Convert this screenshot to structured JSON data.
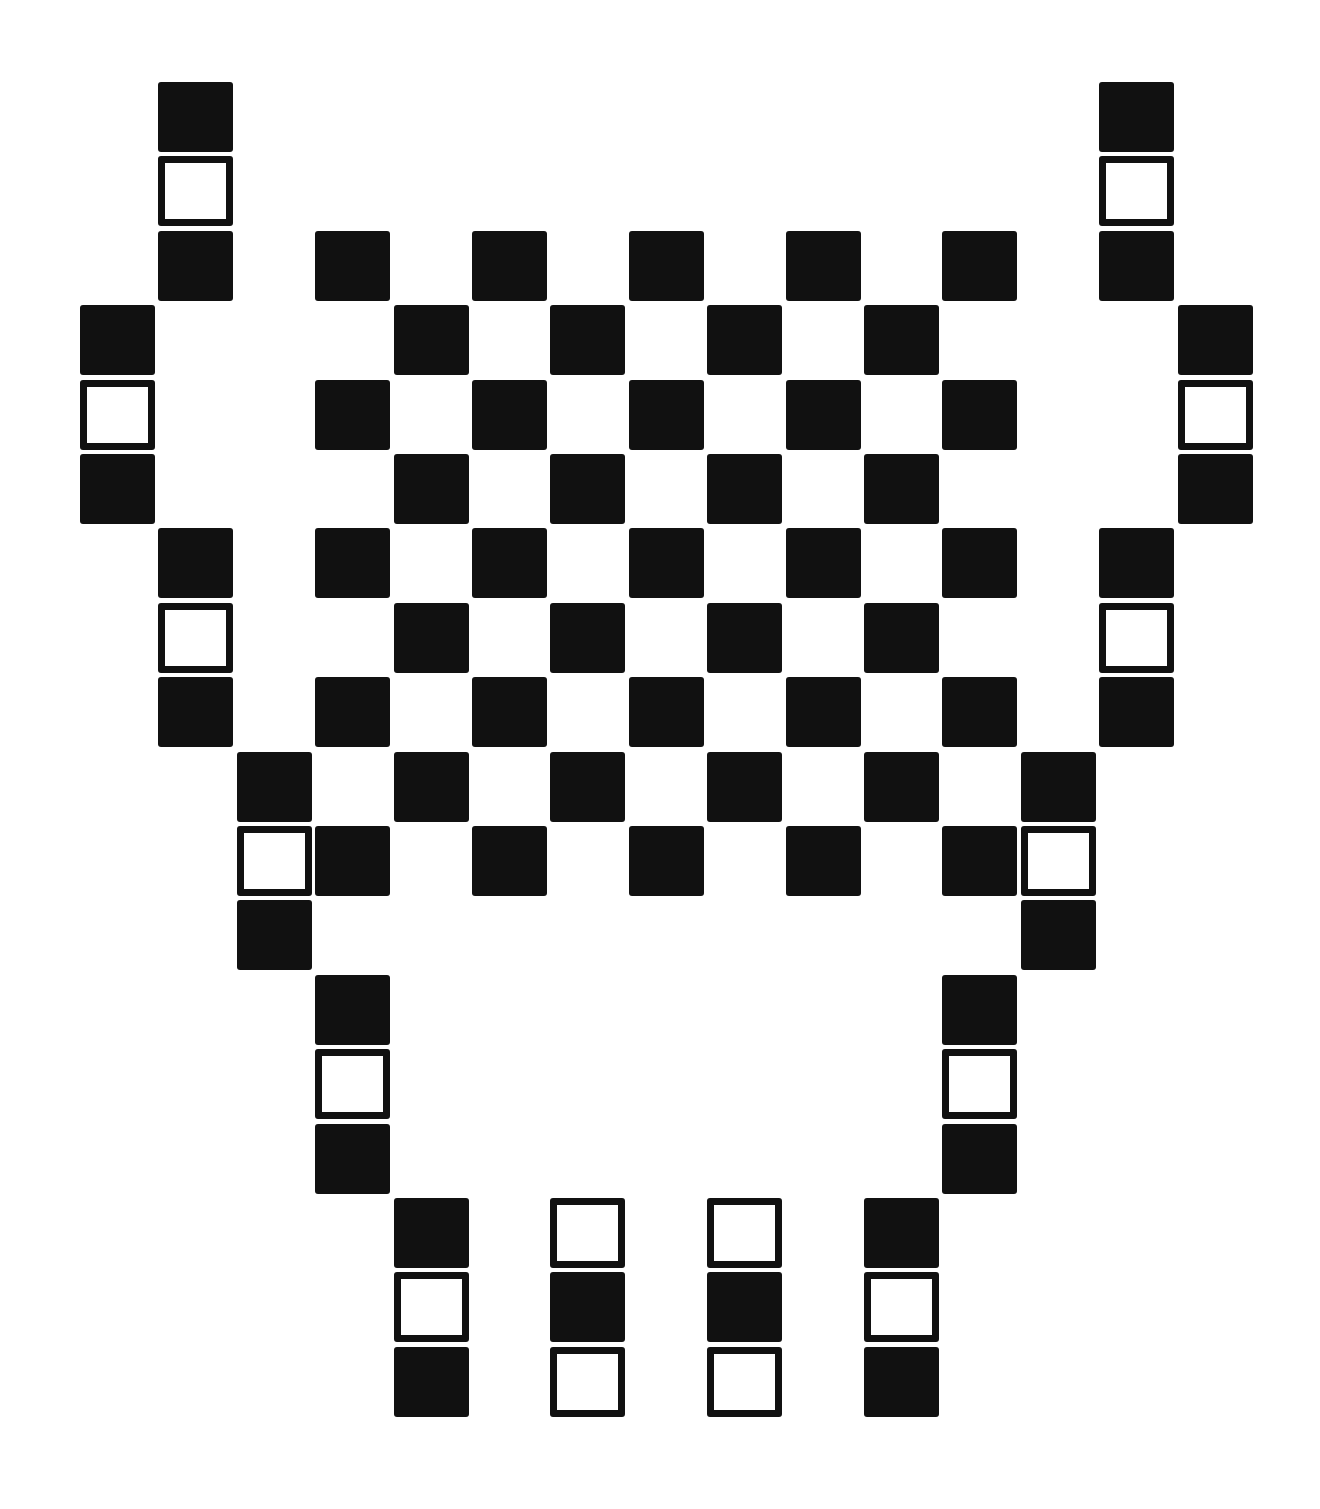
{
  "pattern": {
    "description": "Symmetric black-and-white tile pattern: central checkerboard flanked by vertical triplets (filled-outline-filled) forming a vase/chalice silhouette, with four bottom triplets",
    "colors": {
      "filled": "#111111",
      "outline": "#111111",
      "background": "#ffffff"
    },
    "grid": {
      "origin_x": 80,
      "origin_y": 82,
      "pitch_x": 78.4,
      "pitch_y": 74.4,
      "cell_w": 75,
      "cell_h": 70
    },
    "cells": [
      {
        "c": 1,
        "r": 0,
        "t": "filled"
      },
      {
        "c": 1,
        "r": 1,
        "t": "outline"
      },
      {
        "c": 1,
        "r": 2,
        "t": "filled"
      },
      {
        "c": 0,
        "r": 3,
        "t": "filled"
      },
      {
        "c": 0,
        "r": 4,
        "t": "outline"
      },
      {
        "c": 0,
        "r": 5,
        "t": "filled"
      },
      {
        "c": 1,
        "r": 6,
        "t": "filled"
      },
      {
        "c": 1,
        "r": 7,
        "t": "outline"
      },
      {
        "c": 1,
        "r": 8,
        "t": "filled"
      },
      {
        "c": 2,
        "r": 9,
        "t": "filled"
      },
      {
        "c": 2,
        "r": 10,
        "t": "outline"
      },
      {
        "c": 2,
        "r": 11,
        "t": "filled"
      },
      {
        "c": 3,
        "r": 12,
        "t": "filled"
      },
      {
        "c": 3,
        "r": 13,
        "t": "outline"
      },
      {
        "c": 3,
        "r": 14,
        "t": "filled"
      },
      {
        "c": 13,
        "r": 0,
        "t": "filled"
      },
      {
        "c": 13,
        "r": 1,
        "t": "outline"
      },
      {
        "c": 13,
        "r": 2,
        "t": "filled"
      },
      {
        "c": 14,
        "r": 3,
        "t": "filled"
      },
      {
        "c": 14,
        "r": 4,
        "t": "outline"
      },
      {
        "c": 14,
        "r": 5,
        "t": "filled"
      },
      {
        "c": 13,
        "r": 6,
        "t": "filled"
      },
      {
        "c": 13,
        "r": 7,
        "t": "outline"
      },
      {
        "c": 13,
        "r": 8,
        "t": "filled"
      },
      {
        "c": 12,
        "r": 9,
        "t": "filled"
      },
      {
        "c": 12,
        "r": 10,
        "t": "outline"
      },
      {
        "c": 12,
        "r": 11,
        "t": "filled"
      },
      {
        "c": 11,
        "r": 12,
        "t": "filled"
      },
      {
        "c": 11,
        "r": 13,
        "t": "outline"
      },
      {
        "c": 11,
        "r": 14,
        "t": "filled"
      },
      {
        "c": 3,
        "r": 2,
        "t": "filled"
      },
      {
        "c": 5,
        "r": 2,
        "t": "filled"
      },
      {
        "c": 7,
        "r": 2,
        "t": "filled"
      },
      {
        "c": 9,
        "r": 2,
        "t": "filled"
      },
      {
        "c": 11,
        "r": 2,
        "t": "filled"
      },
      {
        "c": 4,
        "r": 3,
        "t": "filled"
      },
      {
        "c": 6,
        "r": 3,
        "t": "filled"
      },
      {
        "c": 8,
        "r": 3,
        "t": "filled"
      },
      {
        "c": 10,
        "r": 3,
        "t": "filled"
      },
      {
        "c": 3,
        "r": 4,
        "t": "filled"
      },
      {
        "c": 5,
        "r": 4,
        "t": "filled"
      },
      {
        "c": 7,
        "r": 4,
        "t": "filled"
      },
      {
        "c": 9,
        "r": 4,
        "t": "filled"
      },
      {
        "c": 11,
        "r": 4,
        "t": "filled"
      },
      {
        "c": 4,
        "r": 5,
        "t": "filled"
      },
      {
        "c": 6,
        "r": 5,
        "t": "filled"
      },
      {
        "c": 8,
        "r": 5,
        "t": "filled"
      },
      {
        "c": 10,
        "r": 5,
        "t": "filled"
      },
      {
        "c": 3,
        "r": 6,
        "t": "filled"
      },
      {
        "c": 5,
        "r": 6,
        "t": "filled"
      },
      {
        "c": 7,
        "r": 6,
        "t": "filled"
      },
      {
        "c": 9,
        "r": 6,
        "t": "filled"
      },
      {
        "c": 11,
        "r": 6,
        "t": "filled"
      },
      {
        "c": 4,
        "r": 7,
        "t": "filled"
      },
      {
        "c": 6,
        "r": 7,
        "t": "filled"
      },
      {
        "c": 8,
        "r": 7,
        "t": "filled"
      },
      {
        "c": 10,
        "r": 7,
        "t": "filled"
      },
      {
        "c": 3,
        "r": 8,
        "t": "filled"
      },
      {
        "c": 5,
        "r": 8,
        "t": "filled"
      },
      {
        "c": 7,
        "r": 8,
        "t": "filled"
      },
      {
        "c": 9,
        "r": 8,
        "t": "filled"
      },
      {
        "c": 11,
        "r": 8,
        "t": "filled"
      },
      {
        "c": 4,
        "r": 9,
        "t": "filled"
      },
      {
        "c": 6,
        "r": 9,
        "t": "filled"
      },
      {
        "c": 8,
        "r": 9,
        "t": "filled"
      },
      {
        "c": 10,
        "r": 9,
        "t": "filled"
      },
      {
        "c": 3,
        "r": 10,
        "t": "filled"
      },
      {
        "c": 5,
        "r": 10,
        "t": "filled"
      },
      {
        "c": 7,
        "r": 10,
        "t": "filled"
      },
      {
        "c": 9,
        "r": 10,
        "t": "filled"
      },
      {
        "c": 11,
        "r": 10,
        "t": "filled"
      },
      {
        "c": 4,
        "r": 15,
        "t": "filled"
      },
      {
        "c": 4,
        "r": 16,
        "t": "outline"
      },
      {
        "c": 4,
        "r": 17,
        "t": "filled"
      },
      {
        "c": 6,
        "r": 15,
        "t": "outline"
      },
      {
        "c": 6,
        "r": 16,
        "t": "filled"
      },
      {
        "c": 6,
        "r": 17,
        "t": "outline"
      },
      {
        "c": 8,
        "r": 15,
        "t": "outline"
      },
      {
        "c": 8,
        "r": 16,
        "t": "filled"
      },
      {
        "c": 8,
        "r": 17,
        "t": "outline"
      },
      {
        "c": 10,
        "r": 15,
        "t": "filled"
      },
      {
        "c": 10,
        "r": 16,
        "t": "outline"
      },
      {
        "c": 10,
        "r": 17,
        "t": "filled"
      }
    ]
  }
}
